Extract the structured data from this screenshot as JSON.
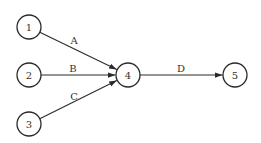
{
  "diagram": {
    "type": "activity-network",
    "nodes": [
      {
        "id": "1",
        "label": "1",
        "x": 29,
        "y": 27
      },
      {
        "id": "2",
        "label": "2",
        "x": 29,
        "y": 75
      },
      {
        "id": "3",
        "label": "3",
        "x": 29,
        "y": 124
      },
      {
        "id": "4",
        "label": "4",
        "x": 128,
        "y": 75
      },
      {
        "id": "5",
        "label": "5",
        "x": 235,
        "y": 75
      }
    ],
    "edges": [
      {
        "from": "1",
        "to": "4",
        "label": "A",
        "lx": 74,
        "ly": 44
      },
      {
        "from": "2",
        "to": "4",
        "label": "B",
        "lx": 73,
        "ly": 72
      },
      {
        "from": "3",
        "to": "4",
        "label": "C",
        "lx": 74,
        "ly": 100
      },
      {
        "from": "4",
        "to": "5",
        "label": "D",
        "lx": 181,
        "ly": 72
      }
    ],
    "node_radius": 12,
    "stroke_color": "#2a2a2a"
  }
}
